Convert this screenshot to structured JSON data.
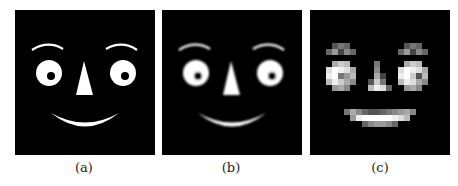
{
  "figure": {
    "panels": [
      {
        "id": "a",
        "label": "(a)",
        "description": "sharp cartoon face"
      },
      {
        "id": "b",
        "label": "(b)",
        "description": "blurred cartoon face"
      },
      {
        "id": "c",
        "label": "(c)",
        "description": "pixelated low-resolution cartoon face"
      }
    ],
    "colors": {
      "background": "#000000",
      "face_features": "#ffffff",
      "page": "#ffffff"
    }
  }
}
